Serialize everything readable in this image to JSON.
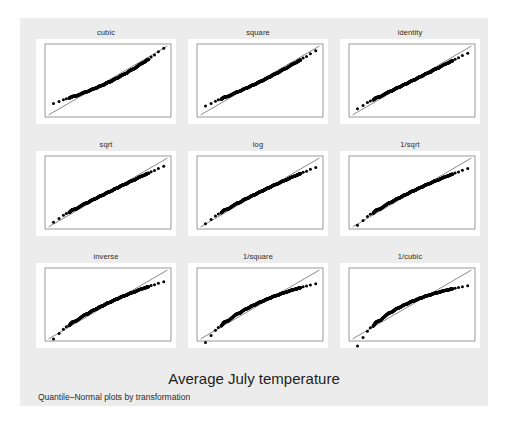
{
  "figure": {
    "title": "Average July temperature",
    "subtitle": "Quantile–Normal plots by transformation",
    "background_color": "#ffffff",
    "graph_region_color": "#ececec",
    "panel_background_color": "#ffffff",
    "marker_color": "#000000",
    "reference_line_color": "#3a3a3a",
    "frame_color": "#6e6e6e"
  },
  "chart_data": {
    "type": "scatter",
    "title": "Average July temperature",
    "subtitle": "Quantile–Normal plots by transformation",
    "xlabel": "",
    "ylabel": "",
    "grid": false,
    "legend": "none",
    "layout": {
      "rows": 3,
      "cols": 3
    },
    "panels": [
      {
        "id": "cubic",
        "label": "cubic",
        "power": 3,
        "row": 0,
        "col": 0,
        "reference_line": true,
        "tail_behavior": "upper tail well above line; lower tail slightly below"
      },
      {
        "id": "square",
        "label": "square",
        "power": 2,
        "row": 0,
        "col": 1,
        "reference_line": true,
        "tail_behavior": "upper tail above line"
      },
      {
        "id": "identity",
        "label": "identity",
        "power": 1,
        "row": 0,
        "col": 2,
        "reference_line": true,
        "tail_behavior": "points follow line closely"
      },
      {
        "id": "sqrt",
        "label": "sqrt",
        "power": 0.5,
        "row": 1,
        "col": 0,
        "reference_line": true,
        "tail_behavior": "near linear, slight lower-tail droop"
      },
      {
        "id": "log",
        "label": "log",
        "power": 0,
        "row": 1,
        "col": 1,
        "reference_line": true,
        "tail_behavior": "slight concavity, lower tail below line"
      },
      {
        "id": "1/sqrt",
        "label": "1/sqrt",
        "power": -0.5,
        "row": 1,
        "col": 2,
        "reference_line": true,
        "tail_behavior": "lower tail below line"
      },
      {
        "id": "inverse",
        "label": "inverse",
        "power": -1,
        "row": 2,
        "col": 0,
        "reference_line": true,
        "tail_behavior": "lower tail clearly below line"
      },
      {
        "id": "1/square",
        "label": "1/square",
        "power": -2,
        "row": 2,
        "col": 1,
        "reference_line": true,
        "tail_behavior": "concave down; both tails below line"
      },
      {
        "id": "1/cubic",
        "label": "1/cubic",
        "power": -3,
        "row": 2,
        "col": 2,
        "reference_line": true,
        "tail_behavior": "strongly concave down; both tails below line"
      }
    ],
    "n_points": 50,
    "base_quantiles": [
      -2.25,
      -2.02,
      -1.84,
      -1.72,
      -1.6,
      -1.52,
      -1.47,
      -1.39,
      -1.3,
      -1.18,
      -1.06,
      -0.97,
      -0.9,
      -0.82,
      -0.74,
      -0.66,
      -0.58,
      -0.5,
      -0.43,
      -0.36,
      -0.29,
      -0.22,
      -0.15,
      -0.08,
      -0.02,
      0.04,
      0.11,
      0.18,
      0.25,
      0.32,
      0.39,
      0.46,
      0.53,
      0.61,
      0.69,
      0.77,
      0.85,
      0.93,
      1.02,
      1.11,
      1.2,
      1.3,
      1.41,
      1.52,
      1.6,
      1.68,
      1.78,
      1.92,
      2.08,
      2.3
    ],
    "observed_wiggle": [
      -0.1,
      -0.05,
      0.01,
      0.03,
      -0.02,
      0.04,
      0.06,
      0.02,
      -0.03,
      0.0,
      0.03,
      0.05,
      0.02,
      -0.02,
      0.01,
      0.04,
      0.02,
      -0.01,
      0.0,
      0.03,
      0.02,
      -0.02,
      -0.01,
      0.02,
      0.03,
      0.01,
      -0.02,
      0.0,
      0.02,
      0.03,
      -0.01,
      0.0,
      0.04,
      0.03,
      0.01,
      -0.01,
      0.03,
      0.05,
      0.02,
      0.0,
      0.03,
      0.06,
      0.04,
      0.02,
      0.05,
      0.03,
      0.06,
      0.04,
      0.07,
      0.05
    ],
    "axis_range_normalized": {
      "x": [
        -2.6,
        2.6
      ],
      "y": [
        -2.6,
        2.6
      ]
    }
  }
}
